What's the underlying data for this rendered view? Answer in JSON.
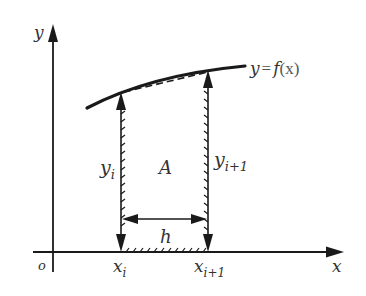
{
  "diagram": {
    "type": "trapezoid-rule-illustration",
    "labels": {
      "y_axis": "y",
      "x_axis": "x",
      "origin": "o",
      "function": "y = f(x)",
      "function_parts": {
        "lhs": "y",
        "eq": "=",
        "f": "f",
        "arg": "(x)"
      },
      "left_height": {
        "base": "y",
        "sub": "i"
      },
      "right_height": {
        "base": "y",
        "sub": "i+1"
      },
      "area": "A",
      "width": "h",
      "left_x": {
        "base": "x",
        "sub": "i"
      },
      "right_x": {
        "base": "x",
        "sub": "i+1"
      }
    },
    "colors": {
      "stroke": "#1a1a1a",
      "text": "#333333",
      "background": "#ffffff"
    }
  }
}
